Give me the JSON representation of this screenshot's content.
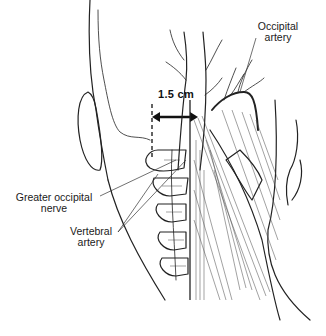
{
  "figure": {
    "measurement": {
      "label": "1.5 cm"
    },
    "labels": {
      "occipital_artery": [
        "Occipital",
        "artery"
      ],
      "greater_occipital_nerve": [
        "Greater occipital",
        "nerve"
      ],
      "vertebral_artery": [
        "Vertebral",
        "artery"
      ]
    },
    "colors": {
      "ink": "#222222",
      "background": "#ffffff"
    }
  }
}
